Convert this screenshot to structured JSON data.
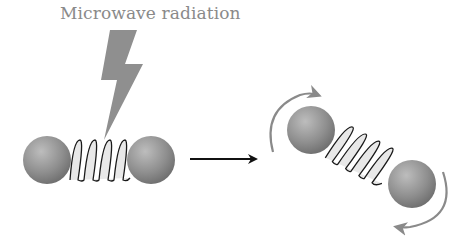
{
  "diagram": {
    "title": "Microwave radiation",
    "colors": {
      "title_text": "#8a8a8a",
      "lightning": "#8f8f8f",
      "sphere_light": "#b5b5b5",
      "sphere_dark": "#6e6e6e",
      "spring_fill": "#e6e6e6",
      "spring_stroke": "#1a1a1a",
      "process_arrow": "#111111",
      "rotation_arrow": "#8a8a8a"
    },
    "nodes": [
      {
        "id": "radiation",
        "label": "Microwave radiation",
        "shape": "lightning-bolt"
      },
      {
        "id": "molecule-before",
        "label": "",
        "shape": "two spheres joined by spring (horizontal)"
      },
      {
        "id": "molecule-after",
        "label": "",
        "shape": "two spheres joined by spring (tilted, rotating)"
      }
    ],
    "edges": [
      {
        "from": "radiation",
        "to": "molecule-before",
        "type": "energy-input"
      },
      {
        "from": "molecule-before",
        "to": "molecule-after",
        "type": "arrow"
      },
      {
        "from": "molecule-after",
        "to": "molecule-after",
        "type": "rotation-arrows",
        "count": 2
      }
    ]
  }
}
